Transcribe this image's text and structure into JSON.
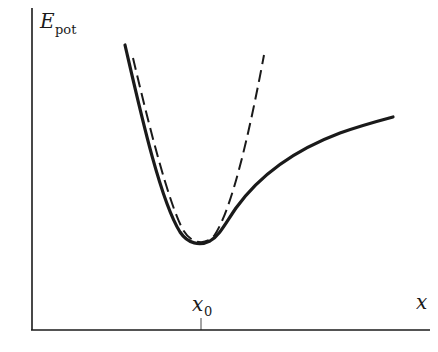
{
  "figure": {
    "y_axis_label": "E",
    "y_axis_label_sub": "pot",
    "x_axis_label": "x",
    "x_tick_label": "x",
    "x_tick_label_sub": "0"
  },
  "curves": [
    {
      "name": "Potential energy (anharmonic, Morse-like)",
      "style": "solid"
    },
    {
      "name": "Harmonic approximation (parabola)",
      "style": "dashed"
    }
  ],
  "colors": {
    "ink": "#1a1a1a",
    "background": "#ffffff"
  }
}
